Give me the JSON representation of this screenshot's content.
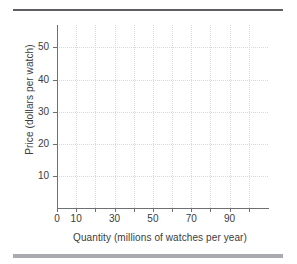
{
  "chart_data": {
    "type": "line",
    "title": "",
    "subtitle": "",
    "xlabel": "Quantity (millions of watches per year)",
    "ylabel": "Price (dollars per watch)",
    "xlim": [
      0,
      110
    ],
    "ylim": [
      0,
      57
    ],
    "grid": true,
    "legend": null,
    "series": [],
    "annotations": [],
    "x_ticks": [
      {
        "value": 0,
        "label": "0"
      },
      {
        "value": 10,
        "label": "10"
      },
      {
        "value": 20,
        "label": ""
      },
      {
        "value": 30,
        "label": "30"
      },
      {
        "value": 40,
        "label": ""
      },
      {
        "value": 50,
        "label": "50"
      },
      {
        "value": 60,
        "label": ""
      },
      {
        "value": 70,
        "label": "70"
      },
      {
        "value": 80,
        "label": ""
      },
      {
        "value": 90,
        "label": "90"
      },
      {
        "value": 100,
        "label": ""
      }
    ],
    "y_ticks": [
      {
        "value": 10,
        "label": "10"
      },
      {
        "value": 20,
        "label": "20"
      },
      {
        "value": 30,
        "label": "30"
      },
      {
        "value": 40,
        "label": "40"
      },
      {
        "value": 50,
        "label": "50"
      }
    ],
    "x_gridlines": [
      10,
      20,
      30,
      40,
      50,
      60,
      70,
      80,
      90,
      100
    ],
    "y_gridlines": [
      10,
      20,
      30,
      40,
      50
    ],
    "colors": {
      "axis": "#6e7074",
      "grid": "#d8d9dc",
      "text": "#3a3c40",
      "rule_top": "#5d5f63",
      "rule_bottom": "#a9abb0",
      "background": "#ffffff"
    }
  }
}
